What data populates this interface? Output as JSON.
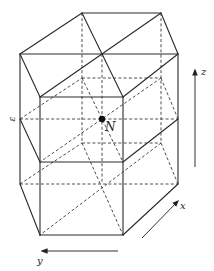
{
  "figure": {
    "width": 214,
    "height": 271,
    "line_color": "#2a2a2a",
    "vertices": {
      "L": [
        20,
        54
      ],
      "B1": [
        82,
        13
      ],
      "B2": [
        161,
        13
      ],
      "R": [
        178,
        54
      ],
      "F2": [
        123,
        97
      ],
      "F1": [
        40,
        97
      ],
      "C": [
        102,
        54
      ],
      "ML": [
        20,
        119
      ],
      "MB1": [
        82,
        78
      ],
      "MB2": [
        161,
        78
      ],
      "MR": [
        178,
        119
      ],
      "MF2": [
        123,
        162
      ],
      "MF1": [
        40,
        162
      ],
      "N": [
        102,
        119
      ],
      "BL": [
        20,
        184
      ],
      "BB1": [
        82,
        143
      ],
      "BB2": [
        161,
        143
      ],
      "BR": [
        178,
        184
      ],
      "BF2": [
        123,
        235
      ],
      "BF1": [
        40,
        235
      ],
      "BC": [
        102,
        184
      ]
    },
    "solid_edges": [
      [
        "L",
        "B1"
      ],
      [
        "B1",
        "B2"
      ],
      [
        "B2",
        "R"
      ],
      [
        "R",
        "F2"
      ],
      [
        "F2",
        "F1"
      ],
      [
        "F1",
        "L"
      ],
      [
        "L",
        "R"
      ],
      [
        "B1",
        "F2"
      ],
      [
        "B2",
        "F1"
      ],
      [
        "ML",
        "MF1"
      ],
      [
        "MF1",
        "MF2"
      ],
      [
        "MF2",
        "MR"
      ],
      [
        "BL",
        "BF1"
      ],
      [
        "BF1",
        "BF2"
      ],
      [
        "BF2",
        "BR"
      ],
      [
        "L",
        "BL"
      ],
      [
        "F1",
        "BF1"
      ],
      [
        "F2",
        "BF2"
      ],
      [
        "R",
        "BR"
      ]
    ],
    "dashed_edges": [
      [
        "ML",
        "MB1"
      ],
      [
        "MB1",
        "MB2"
      ],
      [
        "MB2",
        "MR"
      ],
      [
        "ML",
        "MR"
      ],
      [
        "MB1",
        "MF2"
      ],
      [
        "MB2",
        "MF1"
      ],
      [
        "BL",
        "BB1"
      ],
      [
        "BB1",
        "BB2"
      ],
      [
        "BB2",
        "BR"
      ],
      [
        "BL",
        "BR"
      ],
      [
        "BB1",
        "BF2"
      ],
      [
        "BB2",
        "BF1"
      ],
      [
        "B1",
        "BB1"
      ],
      [
        "B2",
        "BB2"
      ],
      [
        "C",
        "BC"
      ]
    ],
    "center_atom": {
      "label": "N",
      "at": "N",
      "radius": 3.2
    },
    "side_label": {
      "text": "ε",
      "x": 12,
      "y": 119
    },
    "axes": [
      {
        "name": "z",
        "label": "z",
        "from": [
          195,
          167
        ],
        "to": [
          195,
          70
        ],
        "label_pos": [
          201,
          75
        ]
      },
      {
        "name": "x",
        "label": "x",
        "from": [
          142,
          238
        ],
        "to": [
          178,
          201
        ],
        "label_pos": [
          180,
          209
        ]
      },
      {
        "name": "y",
        "label": "y",
        "from": [
          118,
          251
        ],
        "to": [
          42,
          251
        ],
        "label_pos": [
          37,
          264
        ]
      }
    ]
  }
}
